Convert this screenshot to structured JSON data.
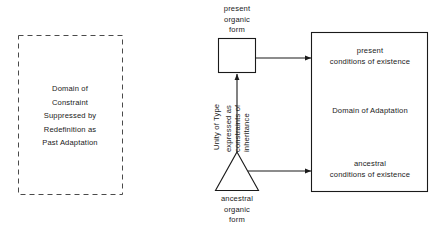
{
  "diagram": {
    "colors": {
      "stroke": "#1a1a1a",
      "dashed_stroke": "#555555",
      "background": "#ffffff",
      "text": "#1a1a1a"
    },
    "dashed_box": {
      "caption": "Domain of\nConstraint\nSuppressed by\nRedefinition as\nPast Adaptation"
    },
    "present_form": {
      "caption": "present\norganic\nform",
      "shape": "square"
    },
    "ancestral_form": {
      "caption": "ancestral\norganic\nform",
      "shape": "triangle"
    },
    "vertical_arrow": {
      "label_primary": "Unity of Type",
      "label_secondary_line1": "expressed as",
      "label_secondary_line2": "constraints of",
      "label_secondary_line3": "inheritance"
    },
    "adaptation_box": {
      "top_caption": "present\nconditions of existence",
      "middle_caption": "Domain of Adaptation",
      "bottom_caption": "ancestral\nconditions of existence"
    }
  }
}
